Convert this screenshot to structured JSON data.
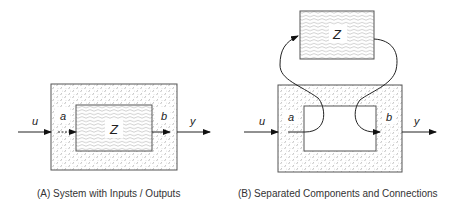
{
  "diagram_a": {
    "caption": "(A) System with Inputs / Outputs",
    "labels": {
      "input": "u",
      "internal_in": "a",
      "component": "Z",
      "internal_out": "b",
      "output": "y"
    }
  },
  "diagram_b": {
    "caption": "(B) Separated Components and Connections",
    "labels": {
      "input": "u",
      "internal_in": "a",
      "component": "Z",
      "internal_out": "b",
      "output": "y"
    }
  },
  "colors": {
    "line": "#222222",
    "border": "#555555",
    "background": "#ffffff"
  }
}
